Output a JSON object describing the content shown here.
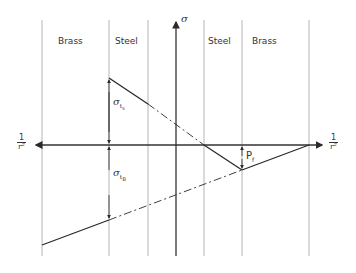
{
  "zones": [
    {
      "label": "Brass",
      "x": 58
    },
    {
      "label": "Steel",
      "x": 118
    },
    {
      "label": "Steel",
      "x": 208
    },
    {
      "label": "Brass",
      "x": 252
    }
  ],
  "axes": {
    "vertical_label": "σ",
    "horizontal_left": {
      "num": "1",
      "den": "r²"
    },
    "horizontal_right": {
      "num": "1",
      "den": "r²"
    }
  },
  "annotations": {
    "sigma_t_steel": {
      "base": "σ",
      "sub": "t",
      "subsub": "s"
    },
    "sigma_t_brass": {
      "base": "σ",
      "sub": "t",
      "subsub": "B"
    },
    "pressure": {
      "base": "P",
      "sub": "f"
    }
  },
  "colors": {
    "line": "#2a2a2a",
    "grid": "#b5b5b5",
    "axis": "#333333"
  }
}
